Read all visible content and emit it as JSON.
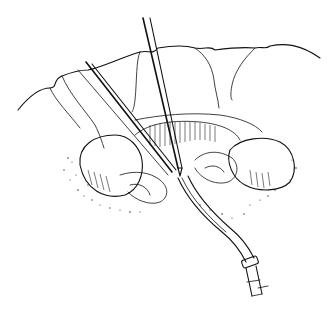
{
  "illustration": {
    "style": "black-and-white pen-and-ink line drawing",
    "subject": "surgical scene with instruments",
    "colors": {
      "ink": "#111111",
      "background": "#ffffff"
    },
    "elements": [
      "surgical-drape-folds",
      "forceps-instrument",
      "long-instrument-shaft",
      "exposed-organ",
      "tissue-and-vessels",
      "ground-stipple",
      "drainage-tube",
      "tube-connector"
    ]
  }
}
